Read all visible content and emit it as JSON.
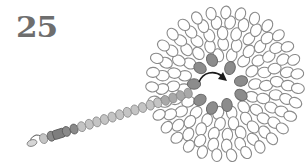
{
  "step": {
    "number": "25"
  },
  "colors": {
    "bead_outline": "#8a8a8a",
    "bead_fill_dark": "#8c8c8c",
    "bead_fill_light": "#c4c4c4",
    "bead_fill_white": "#ffffff",
    "arrow": "#1a1a1a",
    "step_number": "#6e6e6e"
  },
  "flower": {
    "center": [
      225,
      84
    ],
    "rings": [
      {
        "radius": 30,
        "count": 14,
        "rx": 5.2,
        "ry": 6.6
      },
      {
        "radius": 41,
        "count": 19,
        "rx": 5.2,
        "ry": 6.6
      },
      {
        "radius": 52,
        "count": 24,
        "rx": 5.2,
        "ry": 6.6
      },
      {
        "radius": 63,
        "count": 29,
        "rx": 5.2,
        "ry": 6.6
      },
      {
        "radius": 73,
        "count": 31,
        "rx": 5.0,
        "ry": 6.4
      }
    ],
    "hole_radius": 20,
    "filled_beads": [
      [
        200,
        68
      ],
      [
        212,
        60
      ],
      [
        230,
        68
      ],
      [
        194,
        84
      ],
      [
        241,
        81
      ],
      [
        241,
        95
      ],
      [
        200,
        100
      ],
      [
        212,
        108
      ],
      [
        227,
        105
      ]
    ]
  },
  "stem": {
    "start": [
      36,
      141
    ],
    "end": [
      192,
      92
    ],
    "bead_count": 20,
    "dark_segment": [
      1,
      4
    ],
    "end_loop": "clasp-loop"
  },
  "arrow": {
    "path": "M199 82 C 203 72, 214 70, 222 76",
    "head": [
      224,
      78
    ]
  }
}
